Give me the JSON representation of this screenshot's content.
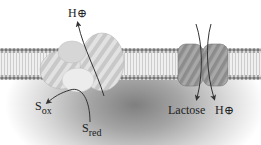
{
  "diagram": {
    "type": "membrane-transport",
    "colors": {
      "membrane_head": "#7a7a7a",
      "membrane_tail": "#d0d0d0",
      "protein_light": "#dcdcdc",
      "protein_stripe": "#bcbcbc",
      "transporter": "#9a9a9a",
      "cytoplasm": "#8a8a8a",
      "arrow": "#333333"
    },
    "labels": {
      "proton_out": {
        "main": "H",
        "symbol": "⊕"
      },
      "s_ox": {
        "main": "S",
        "sub": "ox"
      },
      "s_red": {
        "main": "S",
        "sub": "red"
      },
      "lactose": "Lactose",
      "proton_in": {
        "main": "H",
        "symbol": "⊕"
      }
    },
    "components": [
      {
        "name": "lipid-bilayer"
      },
      {
        "name": "redox-proton-pump",
        "flow": "S_red → S_ox, H⊕ exported"
      },
      {
        "name": "lactose-proton-symporter",
        "flow": "Lactose and H⊕ imported"
      }
    ]
  }
}
